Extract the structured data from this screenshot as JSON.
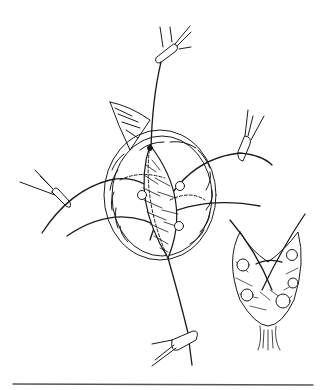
{
  "figure": {
    "type": "surgical line illustration",
    "background": "#ffffff",
    "ink": "#1a1a1a",
    "elements": {
      "clamps": [
        "top-clamp",
        "right-clamp",
        "left-clamp",
        "bottom-clamp"
      ],
      "main_tissue": "oval tissue mass with central incision and crossing sutures",
      "inset": "cross-section detail with circular holes and crossing suture",
      "rule": "horizontal divider line at bottom"
    }
  }
}
